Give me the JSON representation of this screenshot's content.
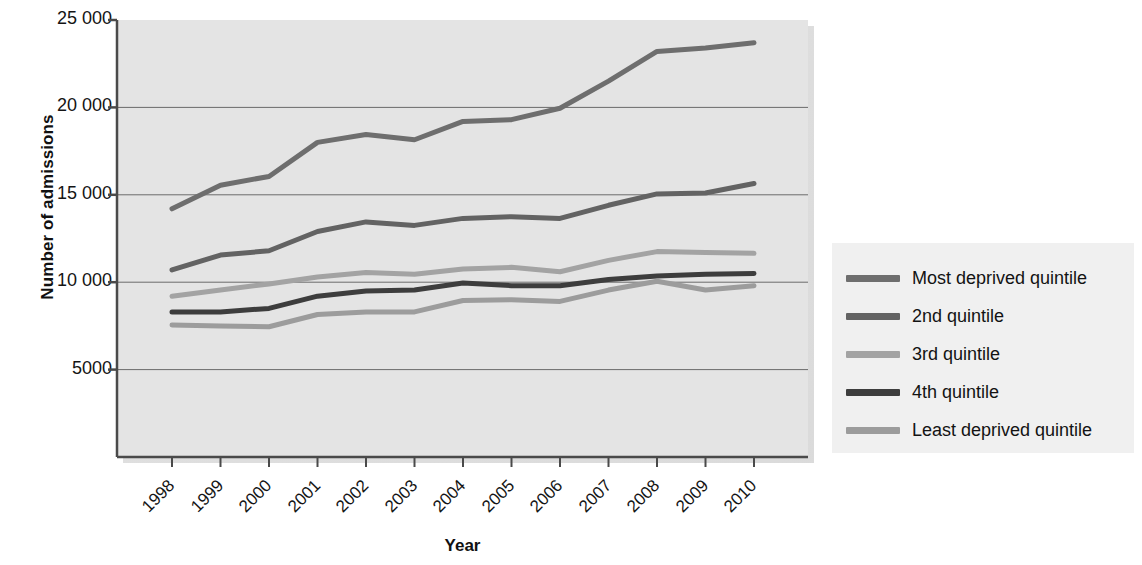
{
  "chart_data": {
    "type": "line",
    "title": "",
    "subtitle": "",
    "xlabel": "Year",
    "ylabel": "Number of admissions",
    "x": [
      1998,
      1999,
      2000,
      2001,
      2002,
      2003,
      2004,
      2005,
      2006,
      2007,
      2008,
      2009,
      2010
    ],
    "categories": [
      "1998",
      "1999",
      "2000",
      "2001",
      "2002",
      "2003",
      "2004",
      "2005",
      "2006",
      "2007",
      "2008",
      "2009",
      "2010"
    ],
    "xlim": [
      1998,
      2010
    ],
    "ylim": [
      0,
      25000
    ],
    "yticks": [
      5000,
      10000,
      15000,
      20000,
      25000
    ],
    "ytick_labels": [
      "5000",
      "10 000",
      "15 000",
      "20 000",
      "25 000"
    ],
    "grid": "horizontal",
    "legend_position": "right",
    "series": [
      {
        "name": "Most deprived quintile",
        "color": "#6e6e6e",
        "values": [
          14200,
          15550,
          16050,
          18000,
          18450,
          18150,
          19200,
          19300,
          19950,
          21500,
          23200,
          23400,
          23700
        ]
      },
      {
        "name": "2nd quintile",
        "color": "#636363",
        "values": [
          10700,
          11550,
          11800,
          12900,
          13450,
          13250,
          13650,
          13750,
          13650,
          14400,
          15050,
          15100,
          15650
        ]
      },
      {
        "name": "3rd quintile",
        "color": "#a3a3a3",
        "values": [
          9200,
          9550,
          9900,
          10300,
          10550,
          10450,
          10750,
          10850,
          10600,
          11250,
          11750,
          11700,
          11650
        ]
      },
      {
        "name": "4th quintile",
        "color": "#3d3d3d",
        "values": [
          8300,
          8300,
          8500,
          9200,
          9500,
          9550,
          9950,
          9800,
          9800,
          10150,
          10350,
          10450,
          10500
        ]
      },
      {
        "name": "Least deprived quintile",
        "color": "#9c9c9c",
        "values": [
          7550,
          7500,
          7450,
          8150,
          8300,
          8300,
          8950,
          9000,
          8900,
          9550,
          10050,
          9550,
          9800
        ]
      }
    ]
  },
  "axes": {
    "y_title": "Number of admissions",
    "x_title": "Year"
  },
  "legend": {
    "items": [
      {
        "label": "Most deprived quintile",
        "color": "#6e6e6e"
      },
      {
        "label": "2nd quintile",
        "color": "#636363"
      },
      {
        "label": "3rd quintile",
        "color": "#a3a3a3"
      },
      {
        "label": "4th quintile",
        "color": "#3d3d3d"
      },
      {
        "label": "Least deprived quintile",
        "color": "#9c9c9c"
      }
    ]
  },
  "colors": {
    "plot_background": "#e4e4e4",
    "legend_background": "#f0f0f0",
    "grid_line": "#6b6b6b",
    "axis_line": "#4a4a4a",
    "page_background": "#ffffff"
  }
}
